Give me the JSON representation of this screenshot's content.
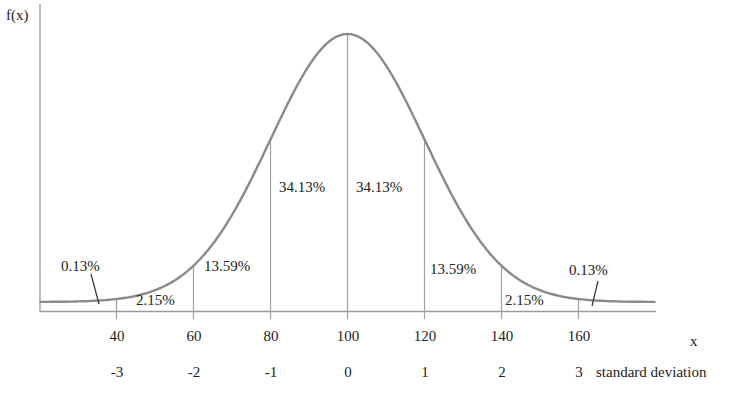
{
  "chart_data": {
    "type": "line",
    "title": "",
    "xlabel": "x",
    "ylabel": "f(x)",
    "mean": 100,
    "std": 20,
    "x_ticks": [
      40,
      60,
      80,
      100,
      120,
      140,
      160
    ],
    "sd_label": "standard deviation",
    "sd_ticks": [
      -3,
      -2,
      -1,
      0,
      1,
      2,
      3
    ],
    "regions": [
      {
        "from": 20,
        "to": 40,
        "percent": "0.13%"
      },
      {
        "from": 40,
        "to": 60,
        "percent": "2.15%"
      },
      {
        "from": 60,
        "to": 80,
        "percent": "13.59%"
      },
      {
        "from": 80,
        "to": 100,
        "percent": "34.13%"
      },
      {
        "from": 100,
        "to": 120,
        "percent": "34.13%"
      },
      {
        "from": 120,
        "to": 140,
        "percent": "13.59%"
      },
      {
        "from": 140,
        "to": 160,
        "percent": "2.15%"
      },
      {
        "from": 160,
        "to": 180,
        "percent": "0.13%"
      }
    ],
    "grid": false,
    "legend": null,
    "colors": {
      "curve": "#8a8a8a",
      "axis": "#9a9a9a",
      "lines": "#a0a0a0",
      "leader": "#333333"
    }
  },
  "labels": {
    "ylabel": "f(x)",
    "xlabel": "x",
    "sd_label": "standard deviation",
    "x_ticks": [
      "40",
      "60",
      "80",
      "100",
      "120",
      "140",
      "160"
    ],
    "sd_ticks": [
      "-3",
      "-2",
      "-1",
      "0",
      "1",
      "2",
      "3"
    ],
    "p_left_tail": "0.13%",
    "p_left_2": "2.15%",
    "p_left_1": "13.59%",
    "p_left_0": "34.13%",
    "p_right_0": "34.13%",
    "p_right_1": "13.59%",
    "p_right_2": "2.15%",
    "p_right_tail": "0.13%"
  }
}
